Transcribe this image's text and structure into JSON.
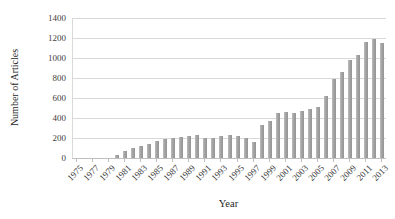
{
  "chart_data": {
    "type": "bar",
    "title": "",
    "xlabel": "Year",
    "ylabel": "Number of Articles",
    "categories": [
      1975,
      1976,
      1977,
      1978,
      1979,
      1980,
      1981,
      1982,
      1983,
      1984,
      1985,
      1986,
      1987,
      1988,
      1989,
      1990,
      1991,
      1992,
      1993,
      1994,
      1995,
      1996,
      1997,
      1998,
      1999,
      2000,
      2001,
      2002,
      2003,
      2004,
      2005,
      2006,
      2007,
      2008,
      2009,
      2010,
      2011,
      2012,
      2013
    ],
    "values": [
      0,
      0,
      0,
      0,
      0,
      30,
      70,
      100,
      120,
      145,
      170,
      195,
      205,
      215,
      225,
      235,
      205,
      205,
      220,
      230,
      220,
      205,
      160,
      330,
      375,
      450,
      460,
      450,
      475,
      495,
      510,
      620,
      790,
      860,
      985,
      1035,
      1165,
      1195,
      1150
    ],
    "xtick_labels": [
      "1975",
      "1977",
      "1979",
      "1981",
      "1983",
      "1985",
      "1987",
      "1989",
      "1991",
      "1993",
      "1995",
      "1997",
      "1999",
      "2001",
      "2003",
      "2005",
      "2007",
      "2009",
      "2011",
      "2013"
    ],
    "ytick_labels": [
      "0",
      "200",
      "400",
      "600",
      "800",
      "1000",
      "1200",
      "1400"
    ],
    "ylim": [
      0,
      1400
    ],
    "ytick_step": 200,
    "grid": "horizontal-on",
    "legend": "none",
    "colors": {
      "bar": "#a6a6a6",
      "gridline": "#d9d9d9",
      "axis": "#bfbfbf",
      "text": "#404040",
      "background": "#ffffff"
    }
  }
}
